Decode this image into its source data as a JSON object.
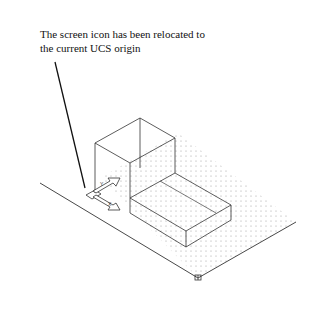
{
  "caption": {
    "line1": "The screen icon has been relocated to",
    "line2": "the current UCS origin"
  },
  "drawing": {
    "view": "isometric",
    "objects": [
      "upper-box",
      "lower-box",
      "ucs-icon",
      "dot-grid",
      "ground-lines",
      "leader-line"
    ],
    "colors": {
      "line": "#222222",
      "grid_dot": "#9a9a9a",
      "background": "#ffffff"
    }
  }
}
